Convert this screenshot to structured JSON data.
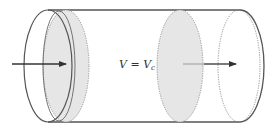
{
  "diagram": {
    "label": {
      "text_main": "V = V",
      "subscript": "c"
    },
    "colors": {
      "stroke": "#555555",
      "shade": "#e6e6e6",
      "arrow": "#333333",
      "background": "#ffffff"
    },
    "elements": [
      "cylinder-body",
      "left-end-ellipse",
      "left-shaded-disc",
      "middle-shaded-disc",
      "right-dashed-ellipse",
      "right-end-ellipse",
      "inflow-arrow",
      "outflow-arrow"
    ]
  }
}
